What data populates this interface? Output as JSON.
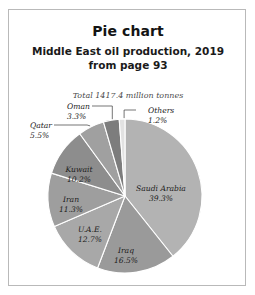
{
  "frame": {
    "border_color": "#b9b9b9"
  },
  "header": {
    "title": "Pie chart",
    "subtitle_line1": "Middle East oil production, 2019",
    "subtitle_line2": "from page 93"
  },
  "chart_data": {
    "type": "pie",
    "title": "Middle East oil production, 2019",
    "subtitle": "from page 93",
    "annotation": "Total 1417.4 million tonnes",
    "total_label": "Total",
    "total_value": 1417.4,
    "units": "million tonnes",
    "value_suffix": "%",
    "start_angle_deg": 0,
    "direction": "clockwise",
    "legend": "none",
    "grid": false,
    "categories": [
      "Saudi Arabia",
      "Iraq",
      "U.A.E.",
      "Iran",
      "Kuwait",
      "Qatar",
      "Oman",
      "Others"
    ],
    "values": [
      39.3,
      16.5,
      12.7,
      11.3,
      10.2,
      5.5,
      3.3,
      1.2
    ],
    "slices": [
      {
        "name": "Saudi Arabia",
        "label": "Saudi Arabia",
        "value_label": "39.3%",
        "value": 39.3,
        "color": "#b3b3b3",
        "label_mode": "inside",
        "label_x": 152,
        "label_y": 181,
        "anchor": "middle"
      },
      {
        "name": "Iraq",
        "label": "Iraq",
        "value_label": "16.5%",
        "value": 16.5,
        "color": "#9a9a9a",
        "label_mode": "inside",
        "label_x": 117,
        "label_y": 243,
        "anchor": "middle"
      },
      {
        "name": "U.A.E.",
        "label": "U.A.E.",
        "value_label": "12.7%",
        "value": 12.7,
        "color": "#a8a8a8",
        "label_mode": "inside",
        "label_x": 81,
        "label_y": 222,
        "anchor": "middle"
      },
      {
        "name": "Iran",
        "label": "Iran",
        "value_label": "11.3%",
        "value": 11.3,
        "color": "#9e9e9e",
        "label_mode": "inside",
        "label_x": 62,
        "label_y": 192,
        "anchor": "middle"
      },
      {
        "name": "Kuwait",
        "label": "Kuwait",
        "value_label": "10.2%",
        "value": 10.2,
        "color": "#8d8d8d",
        "label_mode": "inside",
        "label_x": 70,
        "label_y": 162,
        "anchor": "middle"
      },
      {
        "name": "Qatar",
        "label": "Qatar",
        "value_label": "5.5%",
        "value": 5.5,
        "color": "#a0a0a0",
        "label_mode": "callout",
        "label_x": 21,
        "label_y": 118,
        "anchor": "start"
      },
      {
        "name": "Oman",
        "label": "Oman",
        "value_label": "3.3%",
        "value": 3.3,
        "color": "#7d7d7d",
        "label_mode": "callout",
        "label_x": 58,
        "label_y": 99,
        "anchor": "start"
      },
      {
        "name": "Others",
        "label": "Others",
        "value_label": "1.2%",
        "value": 1.2,
        "color": "#e2e2e2",
        "label_mode": "callout",
        "label_x": 139,
        "label_y": 103,
        "anchor": "start"
      }
    ],
    "geometry": {
      "cx": 116,
      "cy": 186,
      "r": 77
    }
  }
}
